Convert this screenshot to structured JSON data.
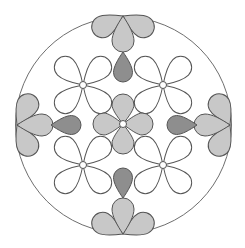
{
  "diagram": {
    "title": "",
    "circle": {
      "cx": 123.5,
      "cy": 125,
      "r": 108
    },
    "colors": {
      "background": "#ffffff",
      "outline": "#6e6e6e",
      "light_fill": "#c8c8c8",
      "dark_fill": "#8e8e8e",
      "empty_fill": "#ffffff",
      "stroke": "#555555"
    },
    "center_flower": {
      "cx": 123,
      "cy": 124,
      "petal_len": 28,
      "petal_w": 11,
      "fill": "light"
    },
    "outline_flowers": [
      {
        "cx": 83,
        "cy": 85
      },
      {
        "cx": 163,
        "cy": 85
      },
      {
        "cx": 83,
        "cy": 165
      },
      {
        "cx": 163,
        "cy": 165
      }
    ],
    "edge_flowers": [
      {
        "side": "top",
        "x": 123,
        "y": 16
      },
      {
        "side": "bottom",
        "x": 123,
        "y": 234
      },
      {
        "side": "left",
        "x": 17,
        "y": 125
      },
      {
        "side": "right",
        "x": 230,
        "y": 125
      }
    ],
    "dark_petals": [
      {
        "side": "top",
        "x": 123,
        "y": 52,
        "dir": "down"
      },
      {
        "side": "bottom",
        "x": 123,
        "y": 198,
        "dir": "up"
      },
      {
        "side": "left",
        "x": 51,
        "y": 125,
        "dir": "right"
      },
      {
        "side": "right",
        "x": 196,
        "y": 125,
        "dir": "left"
      }
    ]
  }
}
